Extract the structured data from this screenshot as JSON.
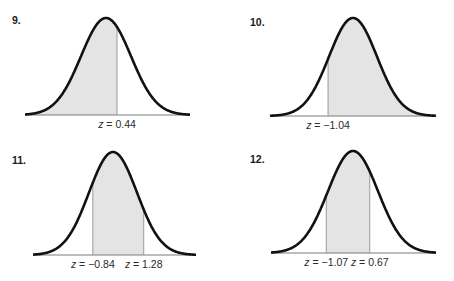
{
  "panels": [
    {
      "number": "9.",
      "shade": {
        "from": null,
        "to": 0.44
      },
      "cutoffs": [
        {
          "z": 0.44,
          "label": "= 0.44"
        }
      ]
    },
    {
      "number": "10.",
      "shade": {
        "from": -1.04,
        "to": null
      },
      "cutoffs": [
        {
          "z": -1.04,
          "label": "= −1.04"
        }
      ]
    },
    {
      "number": "11.",
      "shade": {
        "from": -0.84,
        "to": 1.28
      },
      "cutoffs": [
        {
          "z": -0.84,
          "label": "= −0.84"
        },
        {
          "z": 1.28,
          "label": "= 1.28"
        }
      ]
    },
    {
      "number": "12.",
      "shade": {
        "from": -1.07,
        "to": 0.67
      },
      "cutoffs": [
        {
          "z": -1.07,
          "label": "= −1.07"
        },
        {
          "z": 0.67,
          "label": "= 0.67"
        }
      ]
    }
  ],
  "variable": "z",
  "colors": {
    "curve": "#111111",
    "shade": "#e4e4e4",
    "cutoff_line": "#9a9a9a",
    "baseline": "#7a7a7a"
  }
}
